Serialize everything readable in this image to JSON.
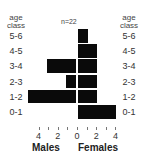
{
  "chart_data": {
    "type": "bar",
    "orientation": "horizontal-population-pyramid",
    "title": "",
    "annotation": "n=22",
    "axis_title_left": "age class",
    "axis_title_right": "age class",
    "categories": [
      "5-6",
      "4-5",
      "3-4",
      "2-3",
      "1-2",
      "0-1"
    ],
    "series": [
      {
        "name": "Males",
        "values": [
          0,
          0,
          3,
          1,
          5,
          0
        ],
        "direction": "left"
      },
      {
        "name": "Females",
        "values": [
          1,
          2,
          2,
          2,
          2,
          4
        ],
        "direction": "right"
      }
    ],
    "xlabel_left": "Males",
    "xlabel_right": "Females",
    "x_tick_labels": [
      "4",
      "2",
      "0",
      "2",
      "4"
    ],
    "xlim": [
      -5,
      4
    ],
    "grid": false,
    "bar_color": "#0a0a0a"
  },
  "labels": {
    "age": "age",
    "class": "class",
    "n": "n=22",
    "males": "Males",
    "females": "Females"
  }
}
